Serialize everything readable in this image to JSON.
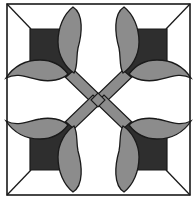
{
  "image": {
    "title": "Quilt block: crossed tulips",
    "description": "Square quilt block with four tulip motifs pointing to the corners, joined by crossed diagonal stems",
    "motif_count": 4
  },
  "colors": {
    "background": "#ffffff",
    "outline": "#1a1a1a",
    "flower": "#2e2e2e",
    "leaf": "#8c8c8c",
    "stem": "#8c8c8c"
  }
}
